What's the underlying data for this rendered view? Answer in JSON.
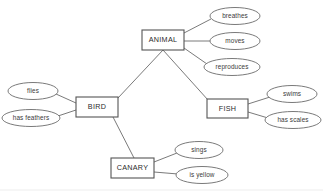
{
  "diagram": {
    "type": "semantic-network",
    "title": "",
    "background_color": "#ffffff",
    "box_stroke_color": "#555555",
    "ellipse_stroke_color": "#6b6b6b",
    "edge_color": "#6b6b6b",
    "text_color": "#2b2b2b",
    "concepts": [
      {
        "id": "animal",
        "label": "ANIMAL",
        "shape": "rect",
        "x": 142,
        "y": 30,
        "w": 42,
        "h": 20
      },
      {
        "id": "bird",
        "label": "BIRD",
        "shape": "rect",
        "x": 76,
        "y": 97,
        "w": 42,
        "h": 20
      },
      {
        "id": "fish",
        "label": "FISH",
        "shape": "rect",
        "x": 207,
        "y": 99,
        "w": 41,
        "h": 19
      },
      {
        "id": "canary",
        "label": "CANARY",
        "shape": "rect",
        "x": 111,
        "y": 158,
        "w": 43,
        "h": 20
      }
    ],
    "properties": [
      {
        "id": "breathes",
        "label": "breathes",
        "shape": "ellipse",
        "cx": 235,
        "cy": 16,
        "rx": 25,
        "ry": 8.5,
        "owner": "animal"
      },
      {
        "id": "moves",
        "label": "moves",
        "shape": "ellipse",
        "cx": 235,
        "cy": 41,
        "rx": 25,
        "ry": 8.5,
        "owner": "animal"
      },
      {
        "id": "reproduces",
        "label": "reproduces",
        "shape": "ellipse",
        "cx": 232,
        "cy": 67,
        "rx": 28,
        "ry": 8.5,
        "owner": "animal"
      },
      {
        "id": "flies",
        "label": "flies",
        "shape": "ellipse",
        "cx": 33,
        "cy": 91,
        "rx": 25,
        "ry": 8.5,
        "owner": "bird"
      },
      {
        "id": "has-feathers",
        "label": "has feathers",
        "shape": "ellipse",
        "cx": 31,
        "cy": 118,
        "rx": 29,
        "ry": 8.5,
        "owner": "bird"
      },
      {
        "id": "swims",
        "label": "swims",
        "shape": "ellipse",
        "cx": 292,
        "cy": 94,
        "rx": 25,
        "ry": 8.5,
        "owner": "fish"
      },
      {
        "id": "has-scales",
        "label": "has scales",
        "shape": "ellipse",
        "cx": 293,
        "cy": 120,
        "rx": 28,
        "ry": 8.5,
        "owner": "fish"
      },
      {
        "id": "sings",
        "label": "sings",
        "shape": "ellipse",
        "cx": 199,
        "cy": 150,
        "rx": 24,
        "ry": 8.5,
        "owner": "canary"
      },
      {
        "id": "is-yellow",
        "label": "is yellow",
        "shape": "ellipse",
        "cx": 202,
        "cy": 175,
        "rx": 26,
        "ry": 8.5,
        "owner": "canary"
      }
    ],
    "links": [
      {
        "id": "animal-bird",
        "from": "animal",
        "to": "bird",
        "x1": 163,
        "y1": 50,
        "x2": 118,
        "y2": 98
      },
      {
        "id": "animal-fish",
        "from": "animal",
        "to": "fish",
        "x1": 163,
        "y1": 50,
        "x2": 208,
        "y2": 100
      },
      {
        "id": "bird-canary",
        "from": "bird",
        "to": "canary",
        "x1": 113,
        "y1": 117,
        "x2": 134,
        "y2": 158
      },
      {
        "id": "animal-breathes",
        "from": "animal",
        "to": "breathes",
        "x1": 184,
        "y1": 33,
        "x2": 211,
        "y2": 19
      },
      {
        "id": "animal-moves",
        "from": "animal",
        "to": "moves",
        "x1": 184,
        "y1": 41,
        "x2": 210,
        "y2": 41
      },
      {
        "id": "animal-reproduces",
        "from": "animal",
        "to": "reproduces",
        "x1": 184,
        "y1": 48,
        "x2": 207,
        "y2": 64
      },
      {
        "id": "bird-flies",
        "from": "bird",
        "to": "flies",
        "x1": 76,
        "y1": 103,
        "x2": 56,
        "y2": 94
      },
      {
        "id": "bird-has-feathers",
        "from": "bird",
        "to": "has-feathers",
        "x1": 76,
        "y1": 110,
        "x2": 58,
        "y2": 116
      },
      {
        "id": "fish-swims",
        "from": "fish",
        "to": "swims",
        "x1": 248,
        "y1": 104,
        "x2": 270,
        "y2": 97
      },
      {
        "id": "fish-has-scales",
        "from": "fish",
        "to": "has-scales",
        "x1": 248,
        "y1": 112,
        "x2": 268,
        "y2": 118
      },
      {
        "id": "canary-sings",
        "from": "canary",
        "to": "sings",
        "x1": 154,
        "y1": 162,
        "x2": 177,
        "y2": 153
      },
      {
        "id": "canary-is-yellow",
        "from": "canary",
        "to": "is-yellow",
        "x1": 154,
        "y1": 172,
        "x2": 178,
        "y2": 174
      }
    ],
    "baseline_rule": {
      "x1": 0,
      "y1": 190,
      "x2": 323,
      "y2": 190
    }
  }
}
